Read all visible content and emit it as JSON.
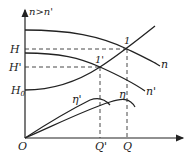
{
  "diagram": {
    "y_axis_label": "n>n'",
    "labels": {
      "H": "H",
      "H_prime": "H'",
      "H0": "H",
      "H0_sub": "0",
      "origin": "O",
      "Q": "Q",
      "Q_prime": "Q'",
      "point1": "1",
      "point1_prime": "1'",
      "curve_n": "n",
      "curve_n_prime": "n'",
      "eta": "η",
      "eta_prime": "η'"
    },
    "colors": {
      "line": "#222222",
      "background": "#ffffff"
    }
  }
}
